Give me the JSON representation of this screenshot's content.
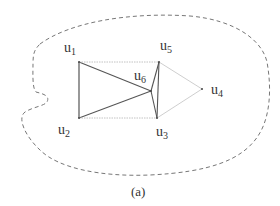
{
  "diagram": {
    "caption": "(a)",
    "region": {
      "style": "dashed",
      "color": "#666666"
    },
    "nodes": [
      {
        "id": "u1",
        "base": "u",
        "sub": "1",
        "x": 79,
        "y": 62,
        "label_x": 64,
        "label_y": 52
      },
      {
        "id": "u2",
        "base": "u",
        "sub": "2",
        "x": 79,
        "y": 118,
        "label_x": 58,
        "label_y": 134
      },
      {
        "id": "u3",
        "base": "u",
        "sub": "3",
        "x": 157,
        "y": 118,
        "label_x": 156,
        "label_y": 136
      },
      {
        "id": "u4",
        "base": "u",
        "sub": "4",
        "x": 202,
        "y": 89,
        "label_x": 211,
        "label_y": 94
      },
      {
        "id": "u5",
        "base": "u",
        "sub": "5",
        "x": 159,
        "y": 62,
        "label_x": 160,
        "label_y": 50
      },
      {
        "id": "u6",
        "base": "u",
        "sub": "6",
        "x": 151,
        "y": 91,
        "label_x": 134,
        "label_y": 80
      }
    ],
    "edges": [
      {
        "from": "u1",
        "to": "u2",
        "style": "solid",
        "color": "#444444"
      },
      {
        "from": "u1",
        "to": "u6",
        "style": "solid",
        "color": "#555555"
      },
      {
        "from": "u2",
        "to": "u6",
        "style": "solid",
        "color": "#555555"
      },
      {
        "from": "u6",
        "to": "u5",
        "style": "solid",
        "color": "#555555"
      },
      {
        "from": "u6",
        "to": "u3",
        "style": "solid",
        "color": "#555555"
      },
      {
        "from": "u5",
        "to": "u3",
        "style": "solid",
        "color": "#555555"
      },
      {
        "from": "u1",
        "to": "u5",
        "style": "dotted",
        "color": "#bbbbbb"
      },
      {
        "from": "u2",
        "to": "u3",
        "style": "dotted",
        "color": "#bbbbbb"
      },
      {
        "from": "u5",
        "to": "u4",
        "style": "light",
        "color": "#c8c8c8"
      },
      {
        "from": "u3",
        "to": "u4",
        "style": "light",
        "color": "#c8c8c8"
      }
    ]
  }
}
